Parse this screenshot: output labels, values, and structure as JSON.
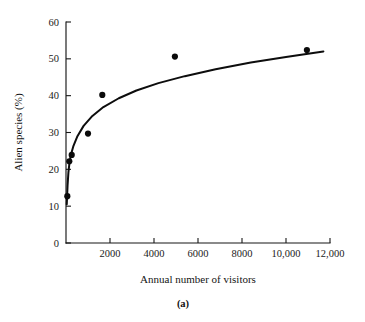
{
  "figure": {
    "panel_label": "(a)",
    "background_color": "#ffffff",
    "ink_color": "#111111"
  },
  "chart_data": {
    "type": "scatter",
    "title": "",
    "subtitle": "",
    "xlabel": "Annual number of visitors",
    "ylabel": "Alien species (%)",
    "xlim": [
      0,
      12000
    ],
    "ylim": [
      0,
      60
    ],
    "grid": false,
    "legend": null,
    "legend_position": "none",
    "x_ticks": [
      0,
      2000,
      4000,
      6000,
      8000,
      10000,
      12000
    ],
    "x_tick_labels": [
      "0",
      "2000",
      "4000",
      "6000",
      "8000",
      "10,000",
      "12,000"
    ],
    "x_tick_labels_shown": [
      "2000",
      "4000",
      "6000",
      "8000",
      "10,000",
      "12,000"
    ],
    "y_ticks": [
      0,
      10,
      20,
      30,
      40,
      50,
      60
    ],
    "y_tick_labels": [
      "0",
      "10",
      "20",
      "30",
      "40",
      "50",
      "60"
    ],
    "points": [
      {
        "x": 60,
        "y": 12.7
      },
      {
        "x": 150,
        "y": 22.2
      },
      {
        "x": 260,
        "y": 23.9
      },
      {
        "x": 1000,
        "y": 29.7
      },
      {
        "x": 1650,
        "y": 40.2
      },
      {
        "x": 4950,
        "y": 50.6
      },
      {
        "x": 10950,
        "y": 52.4
      }
    ],
    "series": [
      {
        "name": "Alien species (%)",
        "marker": "filled-circle",
        "marker_color": "#0b0b0b",
        "values": [
          12.7,
          22.2,
          23.9,
          29.7,
          40.2,
          50.6,
          52.4
        ]
      },
      {
        "name": "fitted curve",
        "type": "line",
        "line_color": "#0d0d0d",
        "description": "saturating logarithmic fit",
        "curve_points": [
          {
            "x": 35,
            "y": 10.5
          },
          {
            "x": 70,
            "y": 15.5
          },
          {
            "x": 110,
            "y": 19.2
          },
          {
            "x": 160,
            "y": 21.9
          },
          {
            "x": 230,
            "y": 24.1
          },
          {
            "x": 340,
            "y": 26.4
          },
          {
            "x": 520,
            "y": 29.0
          },
          {
            "x": 800,
            "y": 31.8
          },
          {
            "x": 1200,
            "y": 34.5
          },
          {
            "x": 1700,
            "y": 36.9
          },
          {
            "x": 2400,
            "y": 39.3
          },
          {
            "x": 3200,
            "y": 41.4
          },
          {
            "x": 4200,
            "y": 43.4
          },
          {
            "x": 5400,
            "y": 45.3
          },
          {
            "x": 6800,
            "y": 47.2
          },
          {
            "x": 8400,
            "y": 49.0
          },
          {
            "x": 10000,
            "y": 50.5
          },
          {
            "x": 11000,
            "y": 51.4
          },
          {
            "x": 11700,
            "y": 52.0
          }
        ]
      }
    ]
  }
}
